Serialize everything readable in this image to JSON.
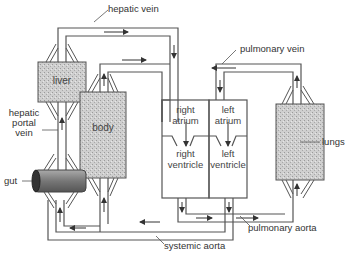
{
  "diagram": {
    "labels": {
      "hepatic_vein": "hepatic vein",
      "pulmonary_vein": "pulmonary vein",
      "hepatic_portal_vein_1": "hepatic",
      "hepatic_portal_vein_2": "portal",
      "hepatic_portal_vein_3": "vein",
      "gut": "gut",
      "lungs": "lungs",
      "pulmonary_aorta": "pulmonary aorta",
      "systemic_aorta": "systemic aorta"
    },
    "organs": {
      "liver": "liver",
      "body": "body"
    },
    "heart": {
      "right_atrium_1": "right",
      "right_atrium_2": "atrium",
      "left_atrium_1": "left",
      "left_atrium_2": "atrium",
      "right_ventricle_1": "right",
      "right_ventricle_2": "ventricle",
      "left_ventricle_1": "left",
      "left_ventricle_2": "ventricle"
    },
    "colors": {
      "line": "#444444",
      "organ_fill": "#c8c8c8",
      "gut_fill": "#8a8a8a"
    }
  }
}
